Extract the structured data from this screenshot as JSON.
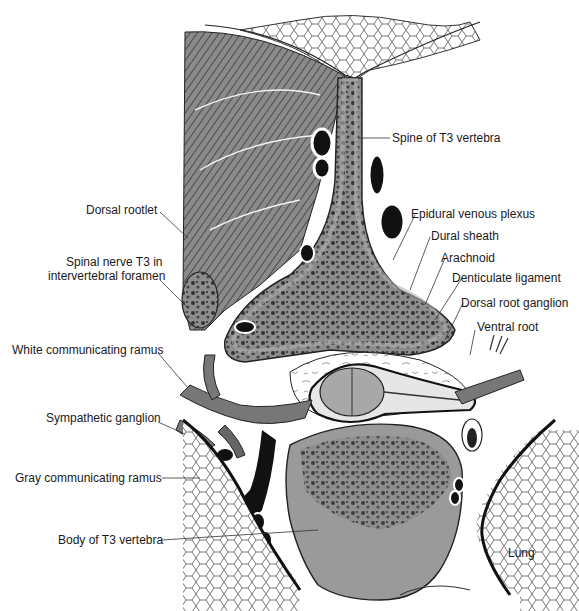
{
  "figure": {
    "colors": {
      "bone": "#9a9a9a",
      "bone_texture": "#3a3a3a",
      "muscle": "#6e6e6e",
      "fat": "#ffffff",
      "vessel": "#111111",
      "nerve": "#777777",
      "cord": "#a8a8a8",
      "outline": "#1a1a1a",
      "label_text": "#1a1a1a"
    }
  },
  "labels": {
    "spine_t3": "Spine of T3 vertebra",
    "dorsal_rootlet": "Dorsal rootlet",
    "epidural_venous_plexus": "Epidural venous plexus",
    "dural_sheath": "Dural sheath",
    "spinal_nerve_line1": "Spinal nerve T3 in",
    "spinal_nerve_line2": "intervertebral foramen",
    "arachnoid": "Arachnoid",
    "denticulate_ligament": "Denticulate ligament",
    "dorsal_root_ganglion": "Dorsal root ganglion",
    "ventral_root": "Ventral root",
    "white_ramus": "White communicating ramus",
    "sympathetic_ganglion": "Sympathetic ganglion",
    "gray_ramus": "Gray communicating ramus",
    "body_t3": "Body of T3 vertebra",
    "lung": "Lung"
  }
}
